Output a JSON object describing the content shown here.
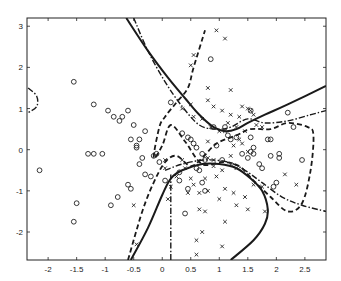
{
  "chart_data": {
    "type": "scatter",
    "title": "",
    "xlabel": "",
    "ylabel": "",
    "xlim": [
      -2.37,
      2.87
    ],
    "ylim": [
      -2.68,
      3.2
    ],
    "grid": false,
    "legend": null,
    "x_ticks": [
      -2,
      -1.5,
      -1,
      -0.5,
      0,
      0.5,
      1,
      1.5,
      2,
      2.5
    ],
    "x_tick_labels": [
      "-2",
      "-1.5",
      "-1",
      "-0.5",
      "0",
      "0.5",
      "1",
      "1.5",
      "2",
      "2.5"
    ],
    "y_ticks": [
      3,
      2,
      1,
      0,
      -1,
      -2
    ],
    "y_tick_labels": [
      "3",
      "2",
      "1",
      "0",
      "-1",
      "-2"
    ],
    "series": [
      {
        "name": "class-o",
        "marker": "circle",
        "points": [
          [
            -2.15,
            -0.5
          ],
          [
            -1.55,
            1.65
          ],
          [
            -1.55,
            -1.75
          ],
          [
            -1.5,
            -1.3
          ],
          [
            -1.3,
            -0.1
          ],
          [
            -1.2,
            -0.1
          ],
          [
            -1.05,
            -0.1
          ],
          [
            -1.2,
            1.1
          ],
          [
            -0.9,
            -1.35
          ],
          [
            -0.95,
            0.95
          ],
          [
            -0.85,
            0.8
          ],
          [
            -0.75,
            0.7
          ],
          [
            -0.78,
            -1.15
          ],
          [
            -0.7,
            0.8
          ],
          [
            -0.6,
            0.95
          ],
          [
            -0.5,
            0.6
          ],
          [
            -0.55,
            0.25
          ],
          [
            -0.45,
            0.1
          ],
          [
            -0.4,
            0.25
          ],
          [
            -0.4,
            -0.35
          ],
          [
            -0.35,
            -0.2
          ],
          [
            -0.3,
            -0.6
          ],
          [
            -0.3,
            0.45
          ],
          [
            -0.2,
            -0.65
          ],
          [
            -0.15,
            -0.15
          ],
          [
            -0.1,
            -0.1
          ],
          [
            -0.05,
            -0.3
          ],
          [
            0.05,
            -0.75
          ],
          [
            -0.6,
            -0.85
          ],
          [
            -0.55,
            -0.95
          ],
          [
            -0.45,
            0.05
          ],
          [
            0.3,
            -0.55
          ],
          [
            0.35,
            0.4
          ],
          [
            0.45,
            0.3
          ],
          [
            0.5,
            0.25
          ],
          [
            0.55,
            0.15
          ],
          [
            0.3,
            -0.75
          ],
          [
            0.45,
            -0.95
          ],
          [
            0.6,
            0.05
          ],
          [
            0.7,
            -0.1
          ],
          [
            0.75,
            -0.25
          ],
          [
            0.9,
            0.55
          ],
          [
            0.95,
            0.1
          ],
          [
            1.1,
            0.55
          ],
          [
            1.15,
            0.35
          ],
          [
            1.2,
            0.25
          ],
          [
            0.6,
            -0.45
          ],
          [
            0.65,
            -0.5
          ],
          [
            0.7,
            -0.8
          ],
          [
            0.75,
            -1.0
          ],
          [
            0.4,
            -1.55
          ],
          [
            1.05,
            -0.25
          ],
          [
            1.3,
            0.3
          ],
          [
            1.4,
            -0.1
          ],
          [
            1.5,
            -0.2
          ],
          [
            1.6,
            -0.1
          ],
          [
            1.7,
            -0.35
          ],
          [
            1.6,
            0.05
          ],
          [
            1.55,
            -0.05
          ],
          [
            1.75,
            -0.45
          ],
          [
            1.55,
            0.3
          ],
          [
            1.9,
            0.25
          ],
          [
            2.05,
            -0.1
          ],
          [
            2.05,
            -0.2
          ],
          [
            2.3,
            0.55
          ],
          [
            2.45,
            -0.25
          ],
          [
            2.2,
            0.9
          ],
          [
            1.55,
            0.95
          ],
          [
            0.15,
            1.15
          ],
          [
            0.85,
            2.2
          ],
          [
            1.85,
            0.25
          ],
          [
            1.9,
            -0.15
          ],
          [
            2.0,
            -0.8
          ],
          [
            1.95,
            -0.9
          ]
        ]
      },
      {
        "name": "class-x",
        "marker": "x",
        "points": [
          [
            0.95,
            2.9
          ],
          [
            1.1,
            2.7
          ],
          [
            0.55,
            2.3
          ],
          [
            0.5,
            2.05
          ],
          [
            0.8,
            1.5
          ],
          [
            1.2,
            1.45
          ],
          [
            0.8,
            1.2
          ],
          [
            0.9,
            1.05
          ],
          [
            1.05,
            0.95
          ],
          [
            1.2,
            0.85
          ],
          [
            1.35,
            0.8
          ],
          [
            0.5,
            1.1
          ],
          [
            0.35,
            1.0
          ],
          [
            0.55,
            0.8
          ],
          [
            0.7,
            0.75
          ],
          [
            0.85,
            0.55
          ],
          [
            1.0,
            0.45
          ],
          [
            1.15,
            0.65
          ],
          [
            1.1,
            0.45
          ],
          [
            1.3,
            0.55
          ],
          [
            1.35,
            0.25
          ],
          [
            1.45,
            0.45
          ],
          [
            1.4,
            1.05
          ],
          [
            1.5,
            1.0
          ],
          [
            1.55,
            0.95
          ],
          [
            1.6,
            0.85
          ],
          [
            1.65,
            0.6
          ],
          [
            1.75,
            0.55
          ],
          [
            1.4,
            0.15
          ],
          [
            1.5,
            -0.05
          ],
          [
            0.8,
            0.2
          ],
          [
            1.25,
            0.1
          ],
          [
            1.2,
            -0.15
          ],
          [
            1.3,
            -0.45
          ],
          [
            0.9,
            -0.25
          ],
          [
            1.05,
            -0.5
          ],
          [
            0.75,
            -0.7
          ],
          [
            0.8,
            -0.2
          ],
          [
            0.95,
            -0.65
          ],
          [
            0.5,
            -0.7
          ],
          [
            0.4,
            -0.45
          ],
          [
            0.35,
            -0.25
          ],
          [
            0.25,
            -0.65
          ],
          [
            0.15,
            -0.9
          ],
          [
            0.45,
            -1.05
          ],
          [
            0.55,
            -0.85
          ],
          [
            0.65,
            -1.05
          ],
          [
            0.8,
            -1.0
          ],
          [
            1.0,
            -1.2
          ],
          [
            1.1,
            -0.95
          ],
          [
            1.25,
            -1.05
          ],
          [
            1.45,
            -1.15
          ],
          [
            1.6,
            -0.85
          ],
          [
            1.75,
            -0.9
          ],
          [
            0.65,
            -1.45
          ],
          [
            0.75,
            -1.5
          ],
          [
            0.7,
            -2.0
          ],
          [
            1.1,
            -1.75
          ],
          [
            1.3,
            -1.35
          ],
          [
            1.5,
            -1.45
          ],
          [
            0.6,
            -2.2
          ],
          [
            0.6,
            -2.55
          ],
          [
            1.05,
            -2.35
          ],
          [
            -0.5,
            -1.35
          ],
          [
            -0.45,
            -2.3
          ],
          [
            0.1,
            -1.2
          ],
          [
            0.05,
            -0.25
          ],
          [
            0.05,
            -0.45
          ],
          [
            2.35,
            -0.85
          ],
          [
            2.15,
            -0.6
          ],
          [
            1.8,
            -1.5
          ],
          [
            0.9,
            -0.4
          ],
          [
            1.2,
            -0.35
          ]
        ]
      }
    ],
    "boundaries": [
      {
        "name": "solid-upper",
        "style": "solid",
        "points": [
          [
            -0.63,
            3.2
          ],
          [
            -0.25,
            2.4
          ],
          [
            0.1,
            1.75
          ],
          [
            0.4,
            1.25
          ],
          [
            0.65,
            0.85
          ],
          [
            0.9,
            0.55
          ],
          [
            1.1,
            0.45
          ],
          [
            1.3,
            0.5
          ],
          [
            1.5,
            0.65
          ],
          [
            1.8,
            0.85
          ],
          [
            2.2,
            1.1
          ],
          [
            2.87,
            1.55
          ]
        ]
      },
      {
        "name": "solid-lower",
        "style": "solid",
        "points": [
          [
            -0.55,
            -2.68
          ],
          [
            -0.25,
            -1.9
          ],
          [
            0.0,
            -1.1
          ],
          [
            0.15,
            -0.7
          ],
          [
            0.35,
            -0.5
          ],
          [
            0.7,
            -0.35
          ],
          [
            1.0,
            -0.35
          ],
          [
            1.3,
            -0.45
          ],
          [
            1.55,
            -0.7
          ],
          [
            1.75,
            -1.0
          ],
          [
            1.85,
            -1.45
          ],
          [
            1.8,
            -1.8
          ],
          [
            1.6,
            -2.2
          ],
          [
            1.2,
            -2.68
          ]
        ]
      },
      {
        "name": "dashed",
        "style": "dashed",
        "points": [
          [
            -0.6,
            -2.68
          ],
          [
            -0.35,
            -1.5
          ],
          [
            -0.15,
            -0.8
          ],
          [
            0.05,
            -0.3
          ],
          [
            0.25,
            -0.15
          ],
          [
            0.5,
            -0.4
          ],
          [
            0.7,
            -0.2
          ],
          [
            0.95,
            0.15
          ],
          [
            1.3,
            0.35
          ],
          [
            1.55,
            0.5
          ],
          [
            1.9,
            0.5
          ],
          [
            2.2,
            0.65
          ],
          [
            2.55,
            0.55
          ],
          [
            2.65,
            0.35
          ],
          [
            2.6,
            -0.5
          ],
          [
            2.45,
            -1.3
          ],
          [
            2.2,
            -1.5
          ],
          [
            1.9,
            -1.15
          ],
          [
            1.6,
            -0.75
          ],
          [
            1.35,
            -0.4
          ],
          [
            1.05,
            -0.3
          ],
          [
            0.7,
            -0.35
          ],
          [
            0.4,
            0.2
          ],
          [
            0.15,
            0.6
          ],
          [
            0.0,
            0.1
          ],
          [
            -0.15,
            -0.2
          ],
          [
            -0.05,
            0.55
          ],
          [
            0.05,
            0.8
          ],
          [
            0.25,
            1.15
          ],
          [
            0.45,
            1.5
          ],
          [
            0.55,
            2.0
          ],
          [
            0.75,
            2.9
          ]
        ]
      },
      {
        "name": "dashdot",
        "style": "dashdot",
        "points": [
          [
            -0.5,
            3.2
          ],
          [
            -0.25,
            2.4
          ],
          [
            0.05,
            1.65
          ],
          [
            0.35,
            1.05
          ],
          [
            0.65,
            0.6
          ],
          [
            0.95,
            0.5
          ],
          [
            1.2,
            0.55
          ],
          [
            1.5,
            0.75
          ],
          [
            1.8,
            0.65
          ],
          [
            2.2,
            0.7
          ],
          [
            2.6,
            0.85
          ],
          [
            2.87,
            0.95
          ]
        ]
      },
      {
        "name": "dashdot-vertical",
        "style": "dashdot",
        "points": [
          [
            0.15,
            -2.68
          ],
          [
            0.15,
            -1.2
          ],
          [
            0.15,
            -0.6
          ]
        ]
      },
      {
        "name": "dashdot-lower",
        "style": "dashdot",
        "points": [
          [
            0.05,
            -0.5
          ],
          [
            0.35,
            -0.35
          ],
          [
            0.75,
            -0.25
          ],
          [
            1.15,
            -0.3
          ],
          [
            1.45,
            -0.5
          ],
          [
            1.75,
            -0.8
          ],
          [
            2.1,
            -1.15
          ],
          [
            2.45,
            -1.35
          ],
          [
            2.87,
            -1.5
          ]
        ]
      },
      {
        "name": "dashdot-left-loop",
        "style": "dashdot",
        "points": [
          [
            -2.35,
            1.5
          ],
          [
            -2.2,
            1.3
          ],
          [
            -2.2,
            1.05
          ],
          [
            -2.35,
            0.9
          ]
        ]
      }
    ]
  }
}
